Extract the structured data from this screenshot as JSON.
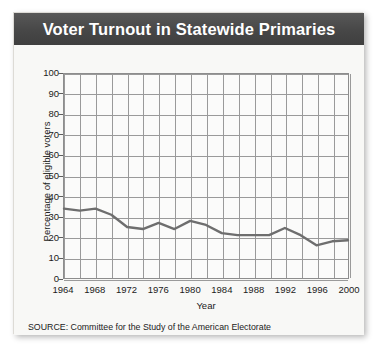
{
  "figure": {
    "title": "Voter Turnout in Statewide Primaries",
    "source_note": "SOURCE: Committee for the Study of the American Electorate",
    "title_bar_color": "#4b4b4b",
    "line_color": "#6e6e6e",
    "grid_color": "#9a9a9a",
    "plot_background": "#fbfbfa",
    "card_background": "#f7f7f5"
  },
  "chart_data": {
    "type": "line",
    "title": "Voter Turnout in Statewide Primaries",
    "xlabel": "Year",
    "ylabel": "Percentage of eligible voters",
    "xlim": [
      1964,
      2000
    ],
    "ylim": [
      0,
      100
    ],
    "grid": true,
    "legend": "none",
    "y_ticks": [
      0,
      10,
      20,
      30,
      40,
      50,
      60,
      70,
      80,
      90,
      100
    ],
    "y_tick_labels": [
      "0",
      "10",
      "20",
      "30",
      "40",
      "50",
      "60",
      "70",
      "80",
      "90",
      "100"
    ],
    "x_ticks": [
      1964,
      1968,
      1972,
      1976,
      1980,
      1984,
      1988,
      1992,
      1996,
      2000
    ],
    "x_tick_labels": [
      "1964",
      "1968",
      "1972",
      "1976",
      "1980",
      "1984",
      "1988",
      "1992",
      "1996",
      "2000"
    ],
    "x_minor_tick_interval": 2,
    "x": [
      1964,
      1966,
      1968,
      1970,
      1972,
      1974,
      1976,
      1978,
      1980,
      1982,
      1984,
      1986,
      1988,
      1990,
      1992,
      1994,
      1996,
      1998,
      2000
    ],
    "values": [
      34,
      33,
      34,
      31,
      25,
      24,
      27,
      24,
      28,
      26,
      22,
      21,
      21,
      21,
      24.5,
      21,
      16,
      18,
      18.5
    ],
    "series": [
      {
        "name": "Percentage of eligible voters",
        "values": [
          34,
          33,
          34,
          31,
          25,
          24,
          27,
          24,
          28,
          26,
          22,
          21,
          21,
          21,
          24.5,
          21,
          16,
          18,
          18.5
        ]
      }
    ]
  }
}
